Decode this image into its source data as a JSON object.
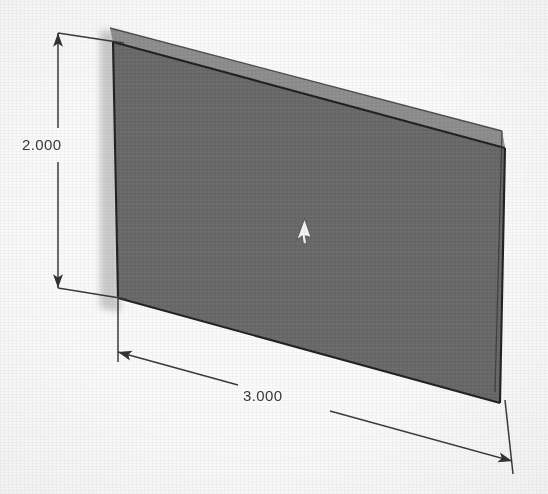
{
  "view": {
    "kind": "cad-isometric-solid-view",
    "background_color": "#fafafa",
    "width_px": 548,
    "height_px": 494
  },
  "model": {
    "name": "rectangular-plate",
    "face_color": "#6a6a6a",
    "top_face_color": "#8e8e8e",
    "side_face_color": "#9a9a9a",
    "edge_color": "#262626",
    "shadow_color": "#b9b9b9",
    "front_face_points": "113,42 505,148 500,403 118,298",
    "top_face_points": "113,42 505,148 500,130 108,27",
    "right_face_points": "505,148 500,403 492,392 497,140",
    "shadow_points": "104,33 118,33 118,310 104,310"
  },
  "dimensions": [
    {
      "id": "height",
      "value": "2.000",
      "orientation": "vertical",
      "line_x": 58,
      "line_top_y": 33,
      "line_bottom_y": 288,
      "text_gap_top": 128,
      "text_gap_bottom": 162,
      "extension_top": "62,33 120,42",
      "extension_bottom": "62,288 122,298"
    },
    {
      "id": "width",
      "value": "3.000",
      "orientation": "horizontal-oblique",
      "start": "118,352",
      "end": "512,461",
      "text_gap_start": "236,385",
      "text_gap_end": "325,410",
      "extension_start": "118,300 118,360",
      "extension_end": "503,405 512,470"
    }
  ],
  "cursor": {
    "name": "mouse-pointer",
    "x": 300,
    "y": 231,
    "color": "#f2f2f2",
    "outline_color": "#5a5a5a",
    "rotation_deg": 200
  }
}
